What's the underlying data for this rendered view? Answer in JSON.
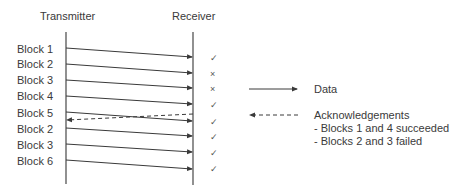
{
  "diagram": {
    "type": "sequence-diagram",
    "header": {
      "transmitter": "Transmitter",
      "receiver": "Receiver"
    },
    "blocks": [
      {
        "label": "Block 1",
        "status": "success",
        "mark": "✓"
      },
      {
        "label": "Block 2",
        "status": "fail",
        "mark": "×"
      },
      {
        "label": "Block 3",
        "status": "fail",
        "mark": "×"
      },
      {
        "label": "Block 4",
        "status": "success",
        "mark": "✓"
      },
      {
        "label": "Block 5",
        "status": "success",
        "mark": "✓"
      },
      {
        "label": "Block 2",
        "status": "success",
        "mark": "✓"
      },
      {
        "label": "Block 3",
        "status": "success",
        "mark": "✓"
      },
      {
        "label": "Block 6",
        "status": "success",
        "mark": "✓"
      }
    ],
    "legend": {
      "data_label": "Data",
      "ack_label": "Acknowledgements",
      "ack_notes": [
        "-  Blocks 1 and 4 succeeded",
        "-  Blocks 2 and 3 failed"
      ]
    },
    "colors": {
      "line": "#3a3a3a",
      "text": "#3a3a3a"
    }
  }
}
